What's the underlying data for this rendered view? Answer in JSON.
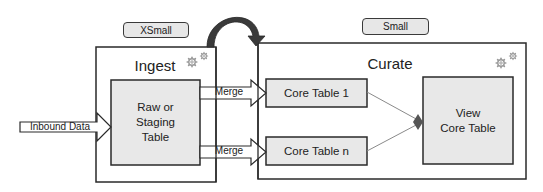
{
  "diagram": {
    "colors": {
      "box_fill": "#e8e8e8",
      "stroke": "#2a2a2a",
      "connector": "#8a8a8a",
      "curved_arrow": "#3a3a3a",
      "gear": "#9a9a9a"
    },
    "badges": {
      "xsmall": "XSmall",
      "small": "Small"
    },
    "ingest": {
      "title": "Ingest",
      "icon": "gears-icon",
      "table": "Raw or\nStaging\nTable"
    },
    "curate": {
      "title": "Curate",
      "icon": "gears-icon",
      "core_table_1": "Core Table 1",
      "core_table_n": "Core Table n",
      "view": "View\nCore Table"
    },
    "arrows": {
      "inbound": "Inbound Data",
      "merge_top": "Merge",
      "merge_bottom": "Merge",
      "curved": "promotion-arrow"
    }
  }
}
